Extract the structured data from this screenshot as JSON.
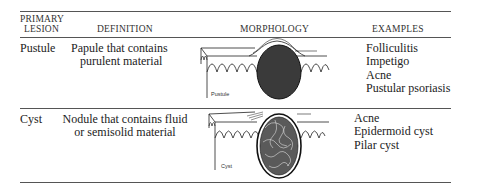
{
  "table": {
    "headers": {
      "lesion_line1": "PRIMARY",
      "lesion_line2": "LESION",
      "definition": "DEFINITION",
      "morphology": "MORPHOLOGY",
      "examples": "EXAMPLES"
    },
    "rows": [
      {
        "lesion": "Pustule",
        "definition_line1": "Papule that contains",
        "definition_line2": "purulent material",
        "morphology_label": "Pustule",
        "examples": [
          "Folliculitis",
          "Impetigo",
          "Acne",
          "Pustular psoriasis"
        ]
      },
      {
        "lesion": "Cyst",
        "definition_line1": "Nodule that contains fluid",
        "definition_line2": "or semisolid material",
        "morphology_label": "Cyst",
        "examples": [
          "Acne",
          "Epidermoid cyst",
          "Pilar cyst"
        ]
      }
    ]
  }
}
